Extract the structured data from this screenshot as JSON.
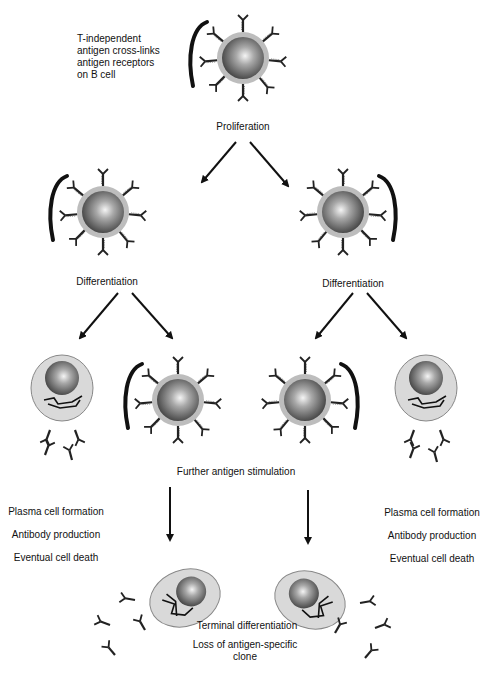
{
  "labels": {
    "intro": [
      "T-independent",
      "antigen cross-links",
      "antigen receptors",
      "on B cell"
    ],
    "proliferation": "Proliferation",
    "differentiation_left": "Differentiation",
    "differentiation_right": "Differentiation",
    "further_stimulation": "Further antigen stimulation",
    "left_outcomes": [
      "Plasma cell formation",
      "Antibody production",
      "Eventual cell death"
    ],
    "right_outcomes": [
      "Plasma cell formation",
      "Antibody production",
      "Eventual cell death"
    ],
    "terminal": "Terminal differentiation",
    "loss": [
      "Loss of antigen-specific",
      "clone"
    ]
  },
  "colors": {
    "cell_membrane": "#bdbdbd",
    "nucleus_light": "#f2f2f2",
    "nucleus_dark": "#4a4a4a",
    "plasma_cytoplasm": "#d9d9d9",
    "ink": "#111111"
  }
}
